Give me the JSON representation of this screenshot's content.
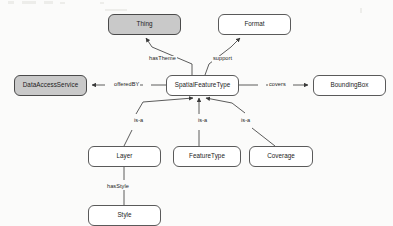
{
  "diagram": {
    "type": "ontology-concept-graph",
    "background_color": "#fbfbfa",
    "shaded_node_color": "#c9c9c9",
    "node_border_color": "#5a5a5a",
    "edge_color": "#4a4a4a",
    "nodes": [
      {
        "id": "thing",
        "label": "Thing",
        "shaded": true,
        "x": 108,
        "y": 14,
        "w": 73,
        "h": 21
      },
      {
        "id": "format",
        "label": "Format",
        "shaded": false,
        "x": 218,
        "y": 14,
        "w": 73,
        "h": 21
      },
      {
        "id": "dataaccessservice",
        "label": "DataAccessService",
        "shaded": true,
        "x": 14,
        "y": 75,
        "w": 73,
        "h": 21
      },
      {
        "id": "spatialfeaturetype",
        "label": "SpatialFeatureType",
        "shaded": false,
        "x": 166,
        "y": 75,
        "w": 73,
        "h": 21
      },
      {
        "id": "boundingbox",
        "label": "BoundingBox",
        "shaded": false,
        "x": 313,
        "y": 75,
        "w": 73,
        "h": 21
      },
      {
        "id": "layer",
        "label": "Layer",
        "shaded": false,
        "x": 88,
        "y": 146,
        "w": 73,
        "h": 21
      },
      {
        "id": "featuretype",
        "label": "FeatureType",
        "shaded": false,
        "x": 173,
        "y": 146,
        "w": 68,
        "h": 21
      },
      {
        "id": "coverage",
        "label": "Coverage",
        "shaded": false,
        "x": 249,
        "y": 146,
        "w": 64,
        "h": 21
      },
      {
        "id": "style",
        "label": "Style",
        "shaded": false,
        "x": 88,
        "y": 205,
        "w": 73,
        "h": 21
      }
    ],
    "edges": [
      {
        "id": "hasTheme",
        "label": "hasTheme",
        "from": "spatialfeaturetype",
        "to": "thing",
        "label_x": 148,
        "label_y": 56
      },
      {
        "id": "support",
        "label": "support",
        "from": "spatialfeaturetype",
        "to": "format",
        "label_x": 212,
        "label_y": 56
      },
      {
        "id": "offeredBY",
        "label": "offeredBY",
        "from": "spatialfeaturetype",
        "to": "dataaccessservice",
        "label_x": 113,
        "label_y": 82
      },
      {
        "id": "covers",
        "label": "covers",
        "from": "spatialfeaturetype",
        "to": "boundingbox",
        "label_x": 268,
        "label_y": 82
      },
      {
        "id": "isa-layer",
        "label": "is-a",
        "from": "layer",
        "to": "spatialfeaturetype",
        "label_x": 133,
        "label_y": 118
      },
      {
        "id": "isa-featuretype",
        "label": "is-a",
        "from": "featuretype",
        "to": "spatialfeaturetype",
        "label_x": 197,
        "label_y": 118
      },
      {
        "id": "isa-coverage",
        "label": "is-a",
        "from": "coverage",
        "to": "spatialfeaturetype",
        "label_x": 240,
        "label_y": 118
      },
      {
        "id": "hasStyle",
        "label": "hasStyle",
        "from": "layer",
        "to": "style",
        "label_x": 106,
        "label_y": 184
      }
    ]
  }
}
